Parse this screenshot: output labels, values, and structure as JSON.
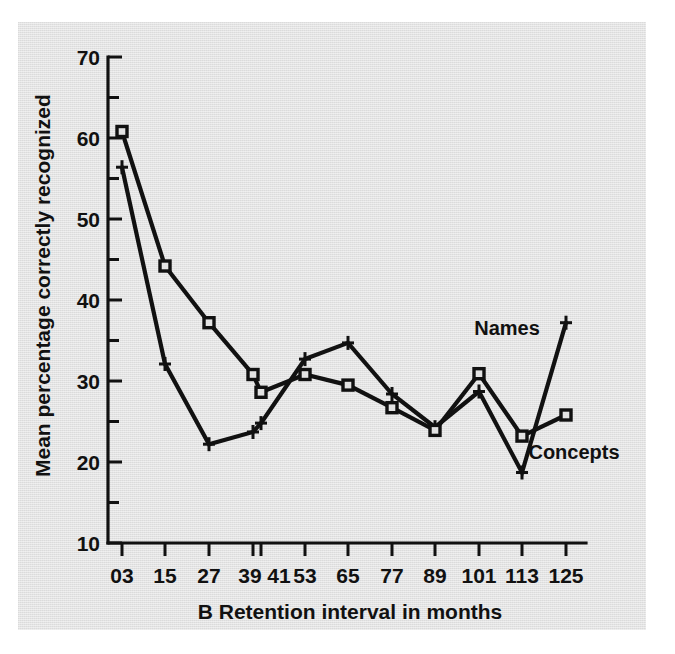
{
  "chart_data": {
    "type": "line",
    "title": "",
    "panel_label": "B",
    "xlabel": "B   Retention interval in months",
    "xlabel_text": "Retention interval in months",
    "ylabel": "Mean percentage correctly recognized",
    "x": [
      3,
      15,
      27,
      39,
      41,
      53,
      65,
      77,
      89,
      101,
      113,
      125
    ],
    "categories": [
      "03",
      "15",
      "27",
      "39",
      "41",
      "53",
      "65",
      "77",
      "89",
      "101",
      "113",
      "125"
    ],
    "xtick_labels": [
      "03",
      "15",
      "27",
      "39",
      "41",
      "53",
      "65",
      "77",
      "89",
      "101",
      "113",
      "125"
    ],
    "ytick_labels": [
      "10",
      "20",
      "30",
      "40",
      "50",
      "60",
      "70"
    ],
    "ytick_values": [
      10,
      20,
      30,
      40,
      50,
      60,
      70
    ],
    "yminor_values": [
      15,
      25,
      35,
      45,
      55,
      65
    ],
    "ylim": [
      10,
      70
    ],
    "grid": false,
    "legend_position": "inline-right",
    "series": [
      {
        "name": "Concepts",
        "marker": "square",
        "values": [
          60.8,
          44.2,
          37.2,
          30.8,
          28.6,
          30.8,
          29.5,
          26.7,
          23.9,
          30.9,
          23.2,
          25.8
        ]
      },
      {
        "name": "Names",
        "marker": "cross",
        "values": [
          56.4,
          32.1,
          22.2,
          23.7,
          24.8,
          32.7,
          34.7,
          28.4,
          24.3,
          28.7,
          18.7,
          37.2
        ]
      }
    ],
    "annotations": [
      {
        "text": "Names",
        "x": 113,
        "y": 40.5
      },
      {
        "text": "Concepts",
        "x": 119,
        "y": 22.5
      }
    ],
    "colors": {
      "background": "#e3e3e3",
      "page": "#ffffff",
      "ink": "#111111"
    }
  }
}
